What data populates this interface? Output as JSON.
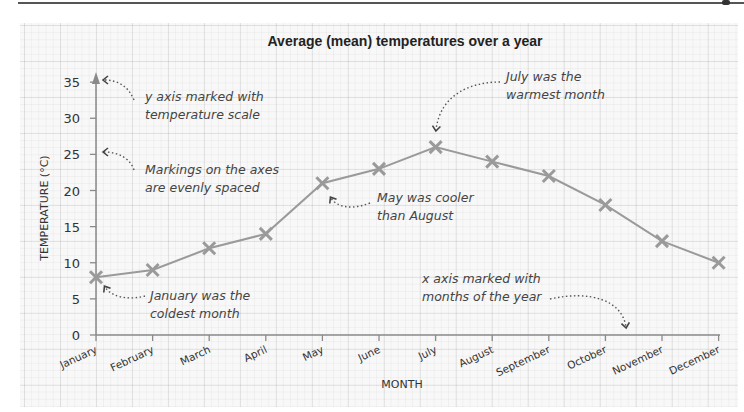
{
  "chart_data": {
    "type": "line",
    "title": "Average (mean) temperatures over a year",
    "xlabel": "MONTH",
    "ylabel": "TEMPERATURE (°C)",
    "categories": [
      "January",
      "February",
      "March",
      "April",
      "May",
      "June",
      "July",
      "August",
      "September",
      "October",
      "November",
      "December"
    ],
    "series": [
      {
        "name": "Average temperature",
        "values": [
          8,
          9,
          12,
          14,
          21,
          23,
          26,
          24,
          22,
          18,
          13,
          10
        ],
        "color": "#9a9a9a",
        "marker": "x"
      }
    ],
    "y_ticks": [
      0,
      5,
      10,
      15,
      20,
      25,
      30,
      35
    ],
    "ylim": [
      0,
      37
    ],
    "grid": true,
    "legend": null,
    "annotations": [
      {
        "text_lines": [
          "y axis marked with",
          "temperature scale"
        ],
        "points_to": "y tick 35"
      },
      {
        "text_lines": [
          "Markings on the axes",
          "are evenly spaced"
        ],
        "points_to": "y tick 25"
      },
      {
        "text_lines": [
          "January was the",
          "coldest month"
        ],
        "points_to": "January (8)"
      },
      {
        "text_lines": [
          "May was cooler",
          "than August"
        ],
        "points_to": "May (21)"
      },
      {
        "text_lines": [
          "July was the",
          "warmest month"
        ],
        "points_to": "July (26)"
      },
      {
        "text_lines": [
          "x axis marked with",
          "months of the year"
        ],
        "points_to": "x axis"
      }
    ]
  },
  "colors": {
    "line": "#9a9a9a",
    "axis": "#8a8a8a",
    "text": "#333333",
    "note": "#444444",
    "paper": "#f8f8f8"
  }
}
